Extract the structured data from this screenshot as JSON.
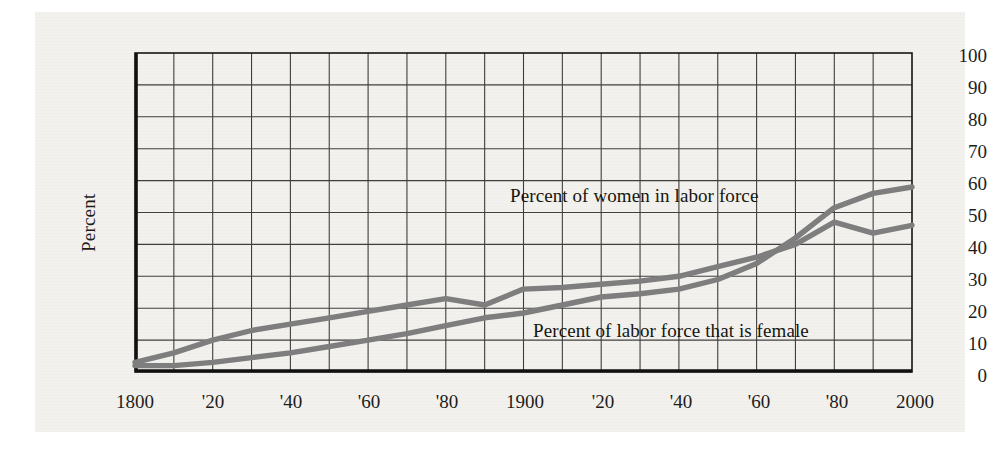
{
  "figure": {
    "background_color": "#f3f1ed",
    "axis_color": "#1a1a1a",
    "grid_color": "#3a3a3a",
    "line_color": "#7e7e7e"
  },
  "axis_titles": {
    "y": "Percent",
    "x": ""
  },
  "y_ticks": [
    "0",
    "10",
    "20",
    "30",
    "40",
    "50",
    "60",
    "70",
    "80",
    "90",
    "100"
  ],
  "x_ticks": [
    "1800",
    "'20",
    "'40",
    "'60",
    "'80",
    "1900",
    "'20",
    "'40",
    "'60",
    "'80",
    "2000"
  ],
  "annotations": [
    {
      "text": "Percent of women in labor force"
    },
    {
      "text": "Percent of labor force that is female"
    }
  ],
  "chart_data": {
    "type": "line",
    "title": "",
    "xlabel": "",
    "ylabel": "Percent",
    "xlim": [
      1800,
      2000
    ],
    "ylim": [
      0,
      100
    ],
    "x_tick_values": [
      1800,
      1820,
      1840,
      1860,
      1880,
      1900,
      1920,
      1940,
      1960,
      1980,
      2000
    ],
    "y_tick_values": [
      0,
      10,
      20,
      30,
      40,
      50,
      60,
      70,
      80,
      90,
      100
    ],
    "grid": true,
    "legend": "inline-annotations",
    "series": [
      {
        "name": "Percent of women in labor force",
        "color": "#7e7e7e",
        "x": [
          1800,
          1810,
          1820,
          1830,
          1840,
          1850,
          1860,
          1870,
          1880,
          1890,
          1900,
          1910,
          1920,
          1930,
          1940,
          1950,
          1960,
          1970,
          1980,
          1990,
          2000
        ],
        "values": [
          2,
          2,
          3,
          4.5,
          6,
          8,
          10,
          12,
          14.5,
          17,
          18.5,
          21,
          23.5,
          24.5,
          26,
          29,
          34,
          42,
          51.5,
          56,
          58
        ]
      },
      {
        "name": "Percent of labor force that is female",
        "color": "#7e7e7e",
        "x": [
          1800,
          1810,
          1820,
          1830,
          1840,
          1850,
          1860,
          1870,
          1880,
          1890,
          1900,
          1910,
          1920,
          1930,
          1940,
          1950,
          1960,
          1970,
          1980,
          1990,
          2000
        ],
        "values": [
          3,
          6,
          10,
          13,
          15,
          17,
          19,
          21,
          23,
          21,
          26,
          26.5,
          27.5,
          28.5,
          30,
          33,
          36,
          40,
          47,
          43.5,
          46
        ]
      }
    ]
  }
}
